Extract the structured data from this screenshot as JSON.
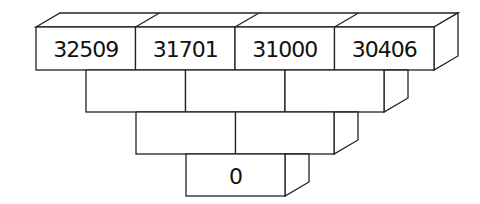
{
  "diagram": {
    "type": "number-pyramid",
    "rows": [
      {
        "cells": [
          "32509",
          "31701",
          "31000",
          "30406"
        ]
      },
      {
        "cells": [
          "",
          "",
          ""
        ]
      },
      {
        "cells": [
          "",
          ""
        ]
      },
      {
        "cells": [
          "0"
        ]
      }
    ]
  }
}
